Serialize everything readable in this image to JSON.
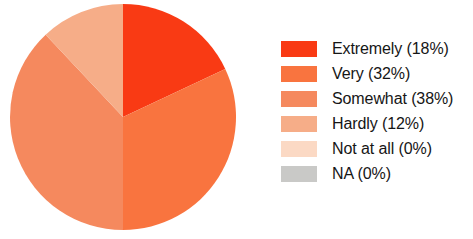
{
  "chart_data": {
    "type": "pie",
    "title": "",
    "subtitle": "",
    "xlabel": "",
    "ylabel": "",
    "grid": false,
    "legend_position": "right",
    "start_angle_deg": 0,
    "direction": "clockwise",
    "center": {
      "x": 123,
      "y": 117
    },
    "radius": 113,
    "categories": [
      "Extremely",
      "Very",
      "Somewhat",
      "Hardly",
      "Not at all",
      "NA"
    ],
    "values": [
      18,
      32,
      38,
      12,
      0,
      0
    ],
    "value_unit": "%",
    "colors": [
      "#f93a14",
      "#f9743f",
      "#f5895e",
      "#f6ad88",
      "#fbd9c4",
      "#c9c9c7"
    ],
    "slices": [
      {
        "label": "Extremely",
        "value": 18,
        "percent": "18%",
        "color": "#f93a14",
        "angle_deg": 64.8
      },
      {
        "label": "Very",
        "value": 32,
        "percent": "32%",
        "color": "#f9743f",
        "angle_deg": 115.2
      },
      {
        "label": "Somewhat",
        "value": 38,
        "percent": "38%",
        "color": "#f5895e",
        "angle_deg": 136.8
      },
      {
        "label": "Hardly",
        "value": 12,
        "percent": "12%",
        "color": "#f6ad88",
        "angle_deg": 43.2
      },
      {
        "label": "Not at all",
        "value": 0,
        "percent": "0%",
        "color": "#fbd9c4",
        "angle_deg": 0
      },
      {
        "label": "NA",
        "value": 0,
        "percent": "0%",
        "color": "#c9c9c7",
        "angle_deg": 0
      }
    ],
    "legend": [
      {
        "label": "Extremely (18%)",
        "color": "#f93a14"
      },
      {
        "label": "Very (32%)",
        "color": "#f9743f"
      },
      {
        "label": "Somewhat (38%)",
        "color": "#f5895e"
      },
      {
        "label": "Hardly (12%)",
        "color": "#f6ad88"
      },
      {
        "label": "Not at all (0%)",
        "color": "#fbd9c4"
      },
      {
        "label": "NA (0%)",
        "color": "#c9c9c7"
      }
    ]
  }
}
